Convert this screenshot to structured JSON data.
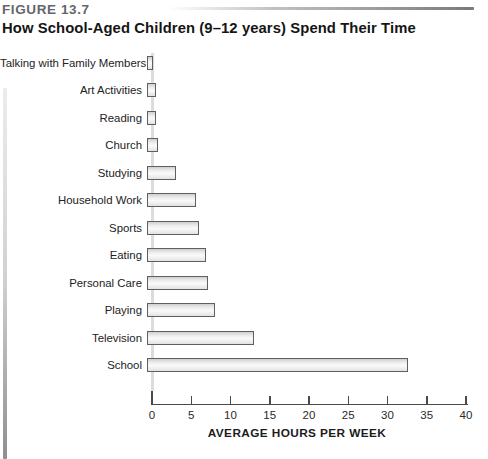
{
  "figure": {
    "label": "FIGURE 13.7",
    "title": "How School-Aged Children (9–12 years) Spend Their Time"
  },
  "chart_data": {
    "type": "bar",
    "orientation": "horizontal",
    "title": "How School-Aged Children (9–12 years) Spend Their Time",
    "categories": [
      "Talking with Family Members",
      "Art Activities",
      "Reading",
      "Church",
      "Studying",
      "Household Work",
      "Sports",
      "Eating",
      "Personal Care",
      "Playing",
      "Television",
      "School"
    ],
    "values": [
      0.8,
      1.1,
      1.2,
      1.4,
      3.7,
      6.3,
      6.6,
      7.5,
      7.8,
      8.6,
      13.6,
      33.3
    ],
    "xlabel": "AVERAGE HOURS PER WEEK",
    "ylabel": "",
    "xlim": [
      0,
      40
    ],
    "xticks": [
      0,
      5,
      10,
      15,
      20,
      25,
      30,
      35,
      40
    ],
    "grid": false,
    "legend": false,
    "colors": {
      "bar_fill_light": "#fafafa",
      "bar_fill_dark": "#cfcfcf",
      "bar_border": "#5f5f5f",
      "axis": "#4a4a4a",
      "figure_label_text": "#64676b",
      "title_text": "#151515"
    }
  }
}
